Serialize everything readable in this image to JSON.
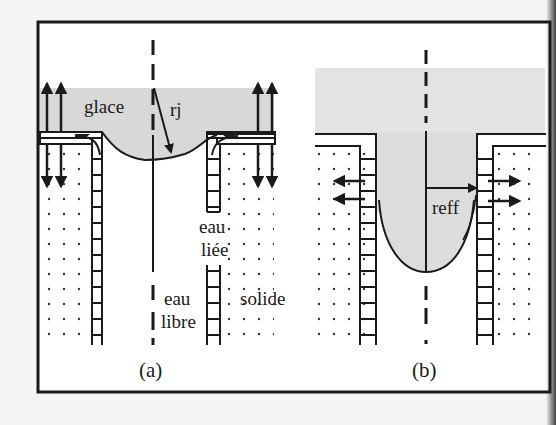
{
  "figure": {
    "panels": [
      {
        "id": "a",
        "caption": "(a)",
        "labels": {
          "ice": "glace",
          "radius": "rj",
          "bound_water_1": "eau",
          "bound_water_2": "liée",
          "free_water_1": "eau",
          "free_water_2": "libre",
          "solid": "solide"
        }
      },
      {
        "id": "b",
        "caption": "(b)",
        "labels": {
          "radius": "reff"
        }
      }
    ],
    "colors": {
      "ink": "#1a1a1a",
      "ice_fill": "#dcdcdc",
      "paper": "#ffffff",
      "background": "#f4f4f2"
    }
  }
}
